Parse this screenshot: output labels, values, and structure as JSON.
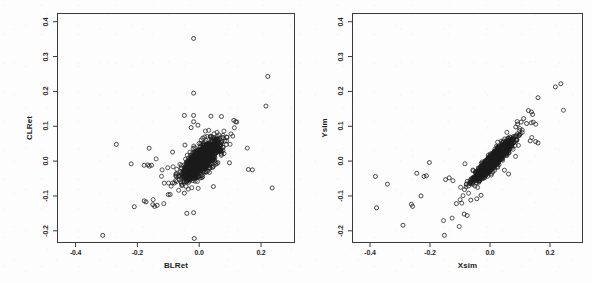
{
  "figure": {
    "width": 592,
    "height": 283,
    "background": "#fdfdfd",
    "point_color": "#1a1a1a",
    "frame_color": "#3a3a3a"
  },
  "chart_data": [
    {
      "type": "scatter",
      "panel": "left",
      "title": "",
      "xlabel": "BLRet",
      "ylabel": "CLRet",
      "xlim": [
        -0.46,
        0.31
      ],
      "ylim": [
        -0.235,
        0.425
      ],
      "xticks": [
        -0.4,
        -0.2,
        0.0,
        0.2
      ],
      "xticklabels": [
        "-0.4",
        "-0.2",
        "0.0",
        "0.2"
      ],
      "yticks": [
        -0.2,
        -0.1,
        0.0,
        0.1,
        0.2,
        0.3,
        0.4
      ],
      "yticklabels": [
        "-0.2",
        "-0.1",
        "0.0",
        "0.1",
        "0.2",
        "0.3",
        "0.4"
      ],
      "grid": false,
      "legend": null,
      "marker": "open-circle",
      "marker_size": 2.6,
      "n_points": 1400,
      "correlation": 0.72,
      "cluster": {
        "x_mean": 0.006,
        "x_sd": 0.028,
        "y_mean": 0.003,
        "y_sd": 0.026
      },
      "outliers": [
        [
          -0.018,
          0.352
        ],
        [
          -0.018,
          0.195
        ],
        [
          0.222,
          0.243
        ],
        [
          0.216,
          0.158
        ],
        [
          -0.048,
          0.131
        ],
        [
          -0.018,
          0.131
        ],
        [
          0.038,
          0.129
        ],
        [
          0.072,
          0.128
        ],
        [
          -0.018,
          0.113
        ],
        [
          0.112,
          0.117
        ],
        [
          0.118,
          0.113
        ],
        [
          -0.004,
          0.103
        ],
        [
          -0.026,
          0.096
        ],
        [
          -0.268,
          0.048
        ],
        [
          -0.162,
          0.037
        ],
        [
          -0.046,
          0.046
        ],
        [
          -0.086,
          0.026
        ],
        [
          -0.22,
          -0.008
        ],
        [
          -0.178,
          -0.012
        ],
        [
          -0.166,
          -0.011
        ],
        [
          -0.154,
          -0.012
        ],
        [
          0.072,
          0.02
        ],
        [
          0.098,
          -0.005
        ],
        [
          0.159,
          -0.024
        ],
        [
          0.172,
          -0.025
        ],
        [
          0.236,
          -0.077
        ],
        [
          -0.21,
          -0.131
        ],
        [
          -0.178,
          -0.114
        ],
        [
          -0.172,
          -0.117
        ],
        [
          -0.15,
          -0.125
        ],
        [
          -0.144,
          -0.13
        ],
        [
          -0.136,
          -0.127
        ],
        [
          -0.1,
          -0.096
        ],
        [
          -0.094,
          -0.096
        ],
        [
          -0.048,
          -0.092
        ],
        [
          -0.04,
          -0.15
        ],
        [
          -0.018,
          -0.148
        ],
        [
          -0.016,
          -0.222
        ],
        [
          -0.312,
          -0.213
        ],
        [
          0.046,
          -0.073
        ]
      ]
    },
    {
      "type": "scatter",
      "panel": "right",
      "title": "",
      "xlabel": "Xsim",
      "ylabel": "Ysim",
      "xlim": [
        -0.46,
        0.31
      ],
      "ylim": [
        -0.235,
        0.425
      ],
      "xticks": [
        -0.4,
        -0.2,
        0.0,
        0.2
      ],
      "xticklabels": [
        "-0.4",
        "-0.2",
        "0.0",
        "0.2"
      ],
      "yticks": [
        -0.2,
        -0.1,
        0.0,
        0.1,
        0.2,
        0.3,
        0.4
      ],
      "yticklabels": [
        "-0.2",
        "-0.1",
        "0.0",
        "0.1",
        "0.2",
        "0.3",
        "0.4"
      ],
      "grid": false,
      "legend": null,
      "marker": "open-circle",
      "marker_size": 2.6,
      "n_points": 1400,
      "correlation": 0.93,
      "cluster": {
        "x_mean": 0.012,
        "x_sd": 0.03,
        "y_mean": 0.004,
        "y_sd": 0.028
      },
      "outliers": [
        [
          0.236,
          0.222
        ],
        [
          0.218,
          0.213
        ],
        [
          0.16,
          0.182
        ],
        [
          0.128,
          0.145
        ],
        [
          0.138,
          0.141
        ],
        [
          0.142,
          0.134
        ],
        [
          0.112,
          0.122
        ],
        [
          0.104,
          0.112
        ],
        [
          0.122,
          0.108
        ],
        [
          0.092,
          0.106
        ],
        [
          0.086,
          0.098
        ],
        [
          0.152,
          0.056
        ],
        [
          0.16,
          0.052
        ],
        [
          0.134,
          0.058
        ],
        [
          -0.202,
          -0.004
        ],
        [
          -0.382,
          -0.044
        ],
        [
          -0.342,
          -0.066
        ],
        [
          -0.244,
          -0.035
        ],
        [
          -0.22,
          -0.044
        ],
        [
          -0.212,
          -0.042
        ],
        [
          -0.148,
          -0.053
        ],
        [
          -0.136,
          -0.048
        ],
        [
          -0.23,
          -0.1
        ],
        [
          -0.262,
          -0.124
        ],
        [
          -0.258,
          -0.13
        ],
        [
          -0.378,
          -0.134
        ],
        [
          -0.29,
          -0.184
        ],
        [
          -0.152,
          -0.213
        ],
        [
          -0.112,
          -0.122
        ],
        [
          -0.086,
          -0.152
        ],
        [
          -0.076,
          -0.156
        ],
        [
          -0.064,
          -0.112
        ],
        [
          -0.044,
          -0.108
        ],
        [
          -0.03,
          -0.098
        ],
        [
          0.048,
          -0.026
        ],
        [
          0.062,
          -0.037
        ]
      ]
    }
  ]
}
